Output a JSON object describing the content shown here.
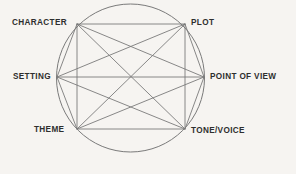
{
  "diagram": {
    "type": "hexagonal-relationship-diagram",
    "shape": "circle-with-inscribed-hexagon",
    "background_color": "#f6f4f1",
    "line_color": "#7a7a7a",
    "text_color": "#2e2e2e",
    "nodes": [
      {
        "id": "character",
        "label": "CHARACTER",
        "position": "top-left",
        "x": 77,
        "y": 24
      },
      {
        "id": "plot",
        "label": "PLOT",
        "position": "top-right",
        "x": 185,
        "y": 24
      },
      {
        "id": "setting",
        "label": "SETTING",
        "position": "middle-left",
        "x": 57,
        "y": 77
      },
      {
        "id": "pov",
        "label": "POINT OF VIEW",
        "position": "middle-right",
        "x": 204,
        "y": 77
      },
      {
        "id": "theme",
        "label": "THEME",
        "position": "bottom-left",
        "x": 77,
        "y": 129
      },
      {
        "id": "tone",
        "label": "TONE/VOICE",
        "position": "bottom-right",
        "x": 185,
        "y": 129
      }
    ],
    "circle": {
      "cx": 130.5,
      "cy": 78,
      "r": 74
    },
    "edges": [
      [
        "character",
        "plot"
      ],
      [
        "character",
        "setting"
      ],
      [
        "character",
        "pov"
      ],
      [
        "character",
        "theme"
      ],
      [
        "character",
        "tone"
      ],
      [
        "plot",
        "setting"
      ],
      [
        "plot",
        "pov"
      ],
      [
        "plot",
        "theme"
      ],
      [
        "plot",
        "tone"
      ],
      [
        "setting",
        "pov"
      ],
      [
        "setting",
        "theme"
      ],
      [
        "setting",
        "tone"
      ],
      [
        "pov",
        "theme"
      ],
      [
        "pov",
        "tone"
      ],
      [
        "theme",
        "tone"
      ]
    ]
  }
}
